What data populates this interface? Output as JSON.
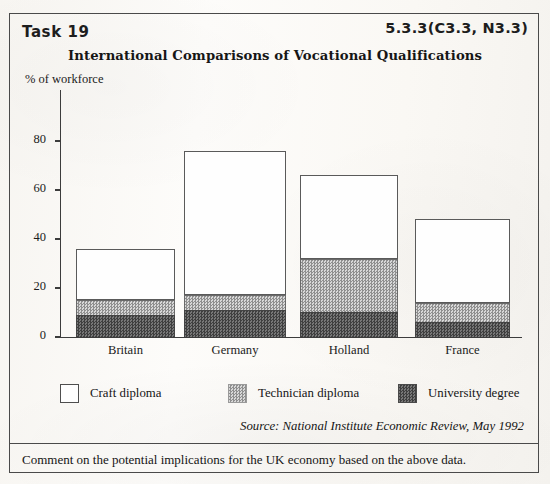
{
  "header": {
    "task_label": "Task 19",
    "task_code": "5.3.3(C3.3, N3.3)"
  },
  "chart_data": {
    "type": "bar",
    "stacked": true,
    "title": "International Comparisons of Vocational Qualifications",
    "xlabel": "",
    "ylabel": "% of workforce",
    "ylim": [
      0,
      90
    ],
    "yticks": [
      0,
      20,
      40,
      60,
      80
    ],
    "ytick_labels": [
      "0",
      "20",
      "40",
      "60",
      "80"
    ],
    "grid": false,
    "legend_position": "below-axes",
    "categories": [
      "Britain",
      "Germany",
      "Holland",
      "France"
    ],
    "series": [
      {
        "name": "University degree",
        "values": [
          9,
          11,
          10,
          6
        ],
        "color": "#4e4e4e"
      },
      {
        "name": "Technician diploma",
        "values": [
          6,
          6,
          22,
          8
        ],
        "color": "#b5b5b5"
      },
      {
        "name": "Craft diploma",
        "values": [
          21,
          59,
          34,
          34
        ],
        "color": "#ffffff"
      }
    ],
    "cumulative_tops": {
      "university_degree": [
        9,
        11,
        10,
        6
      ],
      "technician_diploma": [
        15,
        17,
        32,
        14
      ],
      "total": [
        36,
        76,
        66,
        48
      ]
    },
    "source": "Source: National Institute Economic Review, May 1992"
  },
  "legend": {
    "items": [
      {
        "label": "Craft diploma",
        "swatch": "craft"
      },
      {
        "label": "Technician diploma",
        "swatch": "tech"
      },
      {
        "label": "University degree",
        "swatch": "univ"
      }
    ]
  },
  "footer": {
    "comment": "Comment on the potential implications for the UK economy based on the above data."
  }
}
